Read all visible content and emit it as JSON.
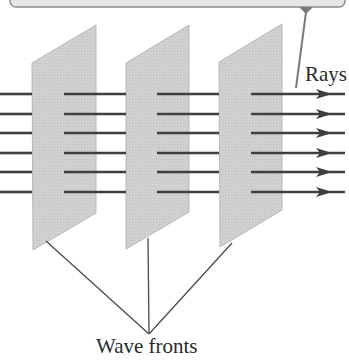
{
  "diagram": {
    "labels": {
      "rays": "Rays",
      "wave_fronts": "Wave fronts"
    },
    "colors": {
      "plate_fill": "#cfcfcf",
      "plate_edge": "#b8b8b8",
      "ray": "#3f3f3f",
      "leader_line": "#4a4a4a",
      "callout_fill": "#e6e6e6",
      "callout_border": "#8e8e8e",
      "callout_pointer": "#7a7a7a",
      "text": "#2a2a2a"
    },
    "callout": {
      "visible_part": "bottom edge of a rounded callout box, cropped at top",
      "pointer_target": "Rays"
    },
    "wave_fronts": [
      {
        "id": 1,
        "points": [
          [
            32,
            63
          ],
          [
            96,
            25
          ],
          [
            96,
            213
          ],
          [
            33,
            250
          ]
        ]
      },
      {
        "id": 2,
        "points": [
          [
            126,
            63
          ],
          [
            189,
            25
          ],
          [
            189,
            212
          ],
          [
            126,
            249
          ]
        ]
      },
      {
        "id": 3,
        "points": [
          [
            219,
            62
          ],
          [
            282,
            24
          ],
          [
            282,
            210
          ],
          [
            220,
            247
          ]
        ]
      }
    ],
    "rays": {
      "count": 6,
      "y": [
        94,
        114,
        133,
        153,
        172,
        192
      ],
      "segments": [
        [
          0,
          32
        ],
        [
          64,
          126
        ],
        [
          157,
          219
        ],
        [
          251,
          345
        ]
      ],
      "arrow_head_x": 332
    },
    "leader_lines": {
      "converge_point": [
        149,
        334
      ],
      "starts": [
        [
          46,
          241
        ],
        [
          148,
          238
        ],
        [
          232,
          243
        ]
      ]
    }
  }
}
